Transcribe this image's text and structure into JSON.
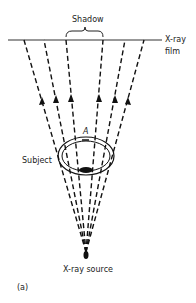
{
  "figure": {
    "labels": {
      "shadow": "Shadow",
      "film_line1": "X-ray",
      "film_line2": "film",
      "subject": "Subject",
      "point_a": "A",
      "source": "X-ray source",
      "panel": "(a)"
    },
    "colors": {
      "ink": "#111111",
      "background": "#ffffff"
    },
    "source_point": [
      86,
      257
    ],
    "film_y": 40,
    "rays_film_x": [
      24,
      44,
      66,
      103,
      125,
      144
    ]
  }
}
